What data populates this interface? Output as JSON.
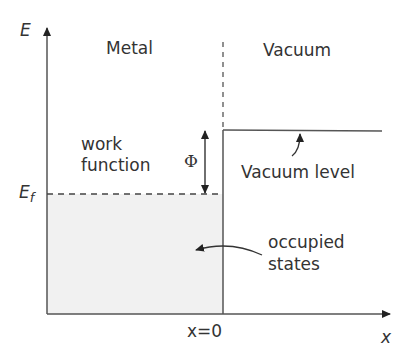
{
  "diagram": {
    "axes": {
      "y_label": "E",
      "x_label": "x",
      "origin_label": "x=0"
    },
    "regions": {
      "left": "Metal",
      "right": "Vacuum"
    },
    "levels": {
      "fermi_label_main": "E",
      "fermi_label_sub": "f",
      "vacuum_level_label": "Vacuum level"
    },
    "annotations": {
      "work_function_line1": "work",
      "work_function_line2": "function",
      "phi_symbol": "Φ",
      "occupied_line1": "occupied",
      "occupied_line2": "states"
    },
    "colors": {
      "line": "#444444",
      "text": "#333333",
      "occupied_fill": "#f1f1f1"
    }
  }
}
